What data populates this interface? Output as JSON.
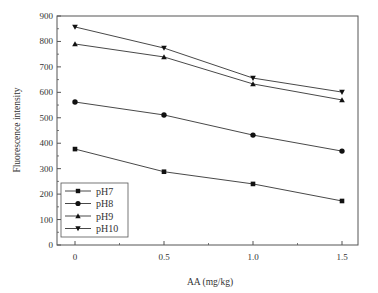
{
  "chart_data": {
    "type": "line",
    "title": "",
    "xlabel": "AA (mg/kg)",
    "ylabel": "Fluorescence intensity",
    "x": [
      0,
      0.5,
      1.0,
      1.5
    ],
    "x_tick_labels": [
      "0",
      "0.5",
      "1.0",
      "1.5"
    ],
    "y_tick_labels": [
      "0",
      "100",
      "200",
      "300",
      "400",
      "500",
      "600",
      "700",
      "800",
      "900"
    ],
    "xlim": [
      -0.1,
      1.6
    ],
    "ylim": [
      0,
      900
    ],
    "grid": false,
    "legend_position": "lower left",
    "series": [
      {
        "name": "pH7",
        "marker": "square",
        "values": [
          377,
          288,
          240,
          173
        ]
      },
      {
        "name": "pH8",
        "marker": "circle",
        "values": [
          562,
          511,
          432,
          369
        ]
      },
      {
        "name": "pH9",
        "marker": "triangle-up",
        "values": [
          790,
          739,
          633,
          570
        ]
      },
      {
        "name": "pH10",
        "marker": "triangle-down",
        "values": [
          857,
          774,
          656,
          601
        ]
      }
    ]
  },
  "colors": {
    "line": "#333333",
    "axis": "#555555",
    "marker": "#111111"
  }
}
